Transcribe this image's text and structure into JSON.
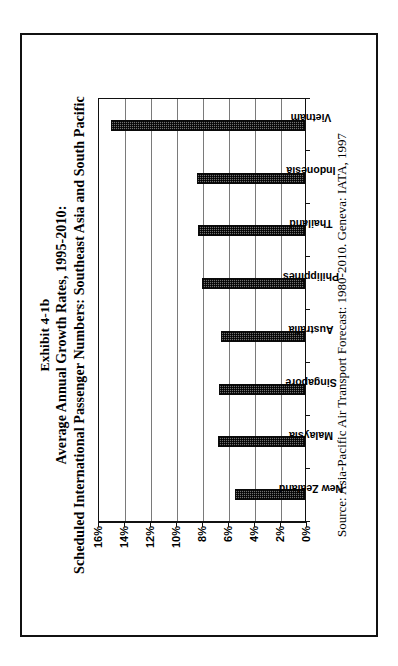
{
  "figure": {
    "exhibit_label": "Exhibit 4-1b",
    "title_line1": "Average Annual Growth Rates, 1995-2010:",
    "title_line2": "Scheduled International Passenger Numbers: Southeast Asia and South Pacific",
    "source": "Source: Asia-Pacific Air Transport Forecast: 1980-2010. Geneva: IATA, 1997"
  },
  "chart_data": {
    "type": "bar",
    "title": "Average Annual Growth Rates, 1995-2010: Scheduled International Passenger Numbers: Southeast Asia and South Pacific",
    "xlabel": "",
    "ylabel": "",
    "categories": [
      "New Zealand",
      "Malaysia",
      "Singapore",
      "Australia",
      "Philippines",
      "Thailand",
      "Indonesia",
      "Vietnam"
    ],
    "values": [
      5.4,
      6.7,
      6.6,
      6.5,
      7.9,
      8.2,
      8.3,
      14.9
    ],
    "value_unit": "%",
    "ylim": [
      0,
      16
    ],
    "yticks": [
      0,
      2,
      4,
      6,
      8,
      10,
      12,
      14,
      16
    ],
    "ytick_labels": [
      "0%",
      "2%",
      "4%",
      "6%",
      "8%",
      "10%",
      "12%",
      "14%",
      "16%"
    ],
    "grid": true,
    "legend": false,
    "bar_fill": "#6f6f6f",
    "bar_edge": "#0a0a0a",
    "gridline_color": "#7a7a7a",
    "axis_color": "#111111",
    "background": "#ffffff"
  }
}
